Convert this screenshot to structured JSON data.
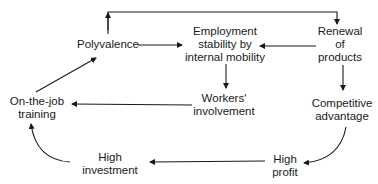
{
  "diagram": {
    "type": "cycle-flow",
    "colors": {
      "line": "#1a1a1a",
      "text": "#1a1a1a",
      "background": "#ffffff"
    },
    "nodes": [
      {
        "id": "polyvalence",
        "lines": [
          "Polyvalence"
        ]
      },
      {
        "id": "employment-stability",
        "lines": [
          "Employment",
          "stability by",
          "internal mobility"
        ]
      },
      {
        "id": "renewal-of-products",
        "lines": [
          "Renewal",
          "of",
          "products"
        ]
      },
      {
        "id": "workers-involvement",
        "lines": [
          "Workers'",
          "involvement"
        ]
      },
      {
        "id": "competitive-advantage",
        "lines": [
          "Competitive",
          "advantage"
        ]
      },
      {
        "id": "on-the-job-training",
        "lines": [
          "On-the-job",
          "training"
        ]
      },
      {
        "id": "high-investment",
        "lines": [
          "High",
          "investment"
        ]
      },
      {
        "id": "high-profit",
        "lines": [
          "High",
          "profit"
        ]
      }
    ],
    "edges": [
      {
        "from": "polyvalence",
        "to": "renewal-of-products",
        "style": "elbow-over-top"
      },
      {
        "from": "polyvalence",
        "to": "employment-stability"
      },
      {
        "from": "renewal-of-products",
        "to": "employment-stability"
      },
      {
        "from": "employment-stability",
        "to": "workers-involvement"
      },
      {
        "from": "renewal-of-products",
        "to": "competitive-advantage"
      },
      {
        "from": "workers-involvement",
        "to": "on-the-job-training"
      },
      {
        "from": "on-the-job-training",
        "to": "polyvalence"
      },
      {
        "from": "competitive-advantage",
        "to": "high-profit",
        "style": "curve"
      },
      {
        "from": "high-profit",
        "to": "high-investment"
      },
      {
        "from": "high-investment",
        "to": "on-the-job-training",
        "style": "curve"
      }
    ]
  }
}
